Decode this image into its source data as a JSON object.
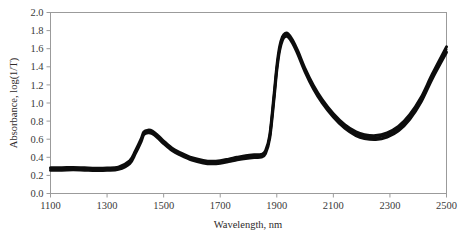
{
  "chart_data": {
    "type": "line",
    "title": "",
    "xlabel": "Wavelength, nm",
    "ylabel": "Absorbance, log(1/T)",
    "xlim": [
      1100,
      2500
    ],
    "ylim": [
      0.0,
      2.0
    ],
    "xticks": [
      1100,
      1300,
      1500,
      1700,
      1900,
      2100,
      2300,
      2500
    ],
    "yticks": [
      0.0,
      0.2,
      0.4,
      0.6,
      0.8,
      1.0,
      1.2,
      1.4,
      1.6,
      1.8,
      2.0
    ],
    "xtick_labels": [
      "1100",
      "1300",
      "1500",
      "1700",
      "1900",
      "2100",
      "2300",
      "2500"
    ],
    "ytick_labels": [
      "0.0",
      "0.2",
      "0.4",
      "0.6",
      "0.8",
      "1.0",
      "1.2",
      "1.4",
      "1.6",
      "1.8",
      "2.0"
    ],
    "grid": false,
    "legend": null,
    "legend_position": "none",
    "annotations": [],
    "line_color": "#0d0d0d",
    "x": [
      1100,
      1140,
      1180,
      1220,
      1260,
      1300,
      1340,
      1380,
      1400,
      1420,
      1430,
      1445,
      1460,
      1480,
      1500,
      1530,
      1560,
      1600,
      1640,
      1670,
      1700,
      1730,
      1760,
      1790,
      1820,
      1845,
      1860,
      1875,
      1890,
      1900,
      1910,
      1920,
      1930,
      1940,
      1955,
      1975,
      2000,
      2030,
      2060,
      2100,
      2140,
      2180,
      2210,
      2250,
      2290,
      2330,
      2370,
      2410,
      2450,
      2500
    ],
    "series": [
      {
        "name": "spectrum-band-upper",
        "values": [
          0.285,
          0.285,
          0.288,
          0.284,
          0.28,
          0.282,
          0.292,
          0.36,
          0.47,
          0.6,
          0.68,
          0.7,
          0.69,
          0.64,
          0.58,
          0.5,
          0.45,
          0.395,
          0.365,
          0.355,
          0.362,
          0.38,
          0.4,
          0.418,
          0.428,
          0.432,
          0.47,
          0.64,
          1.08,
          1.4,
          1.62,
          1.73,
          1.77,
          1.765,
          1.7,
          1.57,
          1.38,
          1.19,
          1.04,
          0.88,
          0.76,
          0.68,
          0.65,
          0.64,
          0.67,
          0.74,
          0.87,
          1.06,
          1.32,
          1.62
        ]
      },
      {
        "name": "spectrum-band-lower",
        "values": [
          0.258,
          0.258,
          0.262,
          0.258,
          0.254,
          0.256,
          0.266,
          0.33,
          0.44,
          0.57,
          0.65,
          0.67,
          0.66,
          0.612,
          0.552,
          0.474,
          0.424,
          0.37,
          0.338,
          0.328,
          0.334,
          0.352,
          0.372,
          0.388,
          0.398,
          0.402,
          0.44,
          0.61,
          1.04,
          1.36,
          1.58,
          1.695,
          1.735,
          1.73,
          1.665,
          1.535,
          1.345,
          1.155,
          1.005,
          0.845,
          0.722,
          0.64,
          0.608,
          0.596,
          0.624,
          0.692,
          0.82,
          1.01,
          1.27,
          1.56
        ]
      },
      {
        "name": "spectrum-band-mid",
        "values": [
          0.271,
          0.271,
          0.275,
          0.271,
          0.267,
          0.269,
          0.279,
          0.345,
          0.455,
          0.585,
          0.665,
          0.685,
          0.675,
          0.626,
          0.566,
          0.487,
          0.437,
          0.382,
          0.351,
          0.341,
          0.348,
          0.366,
          0.386,
          0.403,
          0.413,
          0.417,
          0.455,
          0.625,
          1.06,
          1.38,
          1.6,
          1.712,
          1.752,
          1.747,
          1.682,
          1.552,
          1.362,
          1.172,
          1.022,
          0.862,
          0.741,
          0.66,
          0.629,
          0.618,
          0.647,
          0.716,
          0.845,
          1.035,
          1.295,
          1.59
        ]
      }
    ]
  }
}
